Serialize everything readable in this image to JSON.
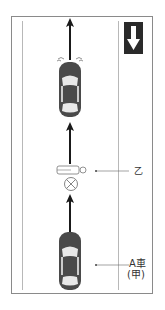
{
  "diagram": {
    "sign": {
      "icon": "one-way-down-arrow-sign",
      "color": "#2a2a2a"
    },
    "labels": {
      "pedestrian": "乙",
      "car_a_line1": "A車",
      "car_a_line2": "(甲)"
    },
    "elements": [
      {
        "type": "car",
        "name": "lead-car",
        "direction": "up",
        "signals": true
      },
      {
        "type": "pedestrian",
        "name": "pedestrian-yi",
        "pose": "lying"
      },
      {
        "type": "impact-marker",
        "name": "collision-point"
      },
      {
        "type": "car",
        "name": "car-a",
        "direction": "up"
      }
    ],
    "colors": {
      "car_body": "#4a4a4a",
      "arrow": "#1a1a1a",
      "frame": "#8a8a8a"
    }
  }
}
